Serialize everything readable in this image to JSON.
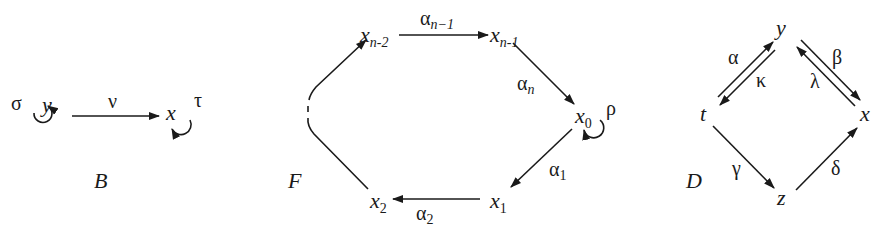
{
  "diagrams": [
    {
      "id": "B",
      "caption": "B",
      "nodes": [
        {
          "id": "y",
          "label": "y"
        },
        {
          "id": "x",
          "label": "x"
        }
      ],
      "edges": [
        {
          "from": "y",
          "to": "x",
          "label": "ν"
        },
        {
          "from": "y",
          "to": "y",
          "label": "σ",
          "loop": true
        },
        {
          "from": "x",
          "to": "x",
          "label": "τ",
          "loop": true
        }
      ]
    },
    {
      "id": "F",
      "caption": "F",
      "nodes": [
        {
          "id": "x_n-2",
          "label": "x",
          "sub": "n-2"
        },
        {
          "id": "x_n-1",
          "label": "x",
          "sub": "n-1"
        },
        {
          "id": "x_0",
          "label": "x",
          "sub": "0"
        },
        {
          "id": "x_1",
          "label": "x",
          "sub": "1"
        },
        {
          "id": "x_2",
          "label": "x",
          "sub": "2"
        }
      ],
      "edges": [
        {
          "from": "x_n-2",
          "to": "x_n-1",
          "label": "α",
          "sub": "n−1"
        },
        {
          "from": "x_n-1",
          "to": "x_0",
          "label": "α",
          "sub": "n"
        },
        {
          "from": "x_0",
          "to": "x_1",
          "label": "α",
          "sub": "1"
        },
        {
          "from": "x_1",
          "to": "x_2",
          "label": "α",
          "sub": "2"
        },
        {
          "from": "x_0",
          "to": "x_0",
          "label": "ρ",
          "loop": true
        },
        {
          "from": "x_2",
          "to": "x_n-2",
          "label": "",
          "dashed_gap": true
        }
      ]
    },
    {
      "id": "D",
      "caption": "D",
      "nodes": [
        {
          "id": "y",
          "label": "y"
        },
        {
          "id": "t",
          "label": "t"
        },
        {
          "id": "x",
          "label": "x"
        },
        {
          "id": "z",
          "label": "z"
        }
      ],
      "edges": [
        {
          "from": "t",
          "to": "y",
          "label": "α"
        },
        {
          "from": "y",
          "to": "t",
          "label": "κ"
        },
        {
          "from": "y",
          "to": "x",
          "label": "β"
        },
        {
          "from": "x",
          "to": "y",
          "label": "λ"
        },
        {
          "from": "t",
          "to": "z",
          "label": "γ"
        },
        {
          "from": "z",
          "to": "x",
          "label": "δ"
        }
      ]
    }
  ],
  "labels": {
    "B": {
      "caption": "B",
      "y": "y",
      "x": "x",
      "nu": "ν",
      "sigma": "σ",
      "tau": "τ"
    },
    "F": {
      "caption": "F",
      "x": "x",
      "s_nm2": "n-2",
      "s_nm1": "n-1",
      "s0": "0",
      "s1": "1",
      "s2": "2",
      "alpha": "α",
      "a_nm1": "n−1",
      "a_n": "n",
      "a1": "1",
      "a2": "2",
      "rho": "ρ"
    },
    "D": {
      "caption": "D",
      "y": "y",
      "t": "t",
      "x": "x",
      "z": "z",
      "alpha": "α",
      "kappa": "κ",
      "beta": "β",
      "lambda": "λ",
      "gamma": "γ",
      "delta": "δ"
    }
  }
}
